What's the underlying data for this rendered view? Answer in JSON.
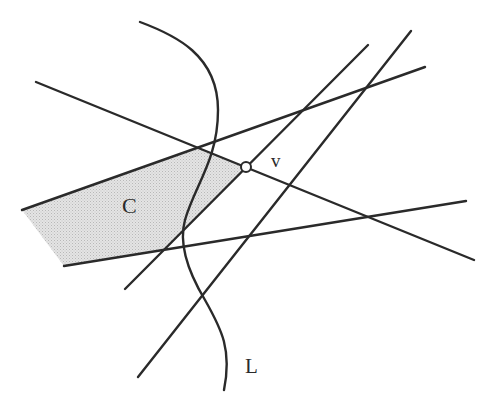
{
  "diagram": {
    "labels": {
      "vertex": "v",
      "region": "C",
      "curve": "L"
    },
    "colors": {
      "line": "#2a2a2a",
      "shade": "#d6d6d6",
      "background": "#ffffff"
    }
  }
}
